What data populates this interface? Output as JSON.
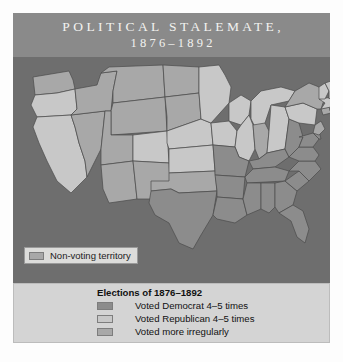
{
  "title": {
    "line1": "POLITICAL STALEMATE,",
    "line2": "1876–1892"
  },
  "map": {
    "ocean_color": "#6e6e6e",
    "border_color": "#4a4a4a",
    "territory_callout": {
      "label": "Non-voting territory",
      "swatch_color": "#a8a8a8"
    },
    "shade_colors": {
      "democrat": "#8c8c8c",
      "republican": "#c8c8c8",
      "irregular": "#a8a8a8",
      "nonvoting": "#a8a8a8"
    },
    "states": [
      {
        "name": "washington",
        "category": "irregular"
      },
      {
        "name": "oregon",
        "category": "republican"
      },
      {
        "name": "california",
        "category": "republican"
      },
      {
        "name": "nevada",
        "category": "irregular"
      },
      {
        "name": "idaho",
        "category": "irregular"
      },
      {
        "name": "montana",
        "category": "irregular"
      },
      {
        "name": "wyoming",
        "category": "irregular"
      },
      {
        "name": "utah",
        "category": "irregular"
      },
      {
        "name": "arizona",
        "category": "irregular"
      },
      {
        "name": "new-mexico",
        "category": "irregular"
      },
      {
        "name": "colorado",
        "category": "republican"
      },
      {
        "name": "north-dakota",
        "category": "irregular"
      },
      {
        "name": "south-dakota",
        "category": "irregular"
      },
      {
        "name": "nebraska",
        "category": "republican"
      },
      {
        "name": "kansas",
        "category": "republican"
      },
      {
        "name": "oklahoma",
        "category": "irregular"
      },
      {
        "name": "texas",
        "category": "democrat"
      },
      {
        "name": "minnesota",
        "category": "republican"
      },
      {
        "name": "iowa",
        "category": "republican"
      },
      {
        "name": "missouri",
        "category": "democrat"
      },
      {
        "name": "arkansas",
        "category": "democrat"
      },
      {
        "name": "louisiana",
        "category": "democrat"
      },
      {
        "name": "wisconsin",
        "category": "republican"
      },
      {
        "name": "illinois",
        "category": "republican"
      },
      {
        "name": "michigan",
        "category": "republican"
      },
      {
        "name": "indiana",
        "category": "irregular"
      },
      {
        "name": "ohio",
        "category": "republican"
      },
      {
        "name": "kentucky",
        "category": "democrat"
      },
      {
        "name": "tennessee",
        "category": "democrat"
      },
      {
        "name": "mississippi",
        "category": "democrat"
      },
      {
        "name": "alabama",
        "category": "democrat"
      },
      {
        "name": "georgia",
        "category": "democrat"
      },
      {
        "name": "florida",
        "category": "democrat"
      },
      {
        "name": "south-carolina",
        "category": "democrat"
      },
      {
        "name": "north-carolina",
        "category": "democrat"
      },
      {
        "name": "virginia",
        "category": "democrat"
      },
      {
        "name": "west-virginia",
        "category": "democrat"
      },
      {
        "name": "maryland",
        "category": "democrat"
      },
      {
        "name": "delaware",
        "category": "democrat"
      },
      {
        "name": "pennsylvania",
        "category": "republican"
      },
      {
        "name": "new-jersey",
        "category": "irregular"
      },
      {
        "name": "new-york",
        "category": "irregular"
      },
      {
        "name": "connecticut",
        "category": "irregular"
      },
      {
        "name": "rhode-island",
        "category": "republican"
      },
      {
        "name": "massachusetts",
        "category": "republican"
      },
      {
        "name": "vermont",
        "category": "republican"
      },
      {
        "name": "new-hampshire",
        "category": "republican"
      },
      {
        "name": "maine",
        "category": "republican"
      }
    ]
  },
  "legend": {
    "heading": "Elections of 1876–1892",
    "entries": [
      {
        "label": "Voted Democrat 4–5 times",
        "color": "#8c8c8c"
      },
      {
        "label": "Voted Republican 4–5 times",
        "color": "#c8c8c8"
      },
      {
        "label": "Voted more irregularly",
        "color": "#a8a8a8"
      }
    ]
  }
}
